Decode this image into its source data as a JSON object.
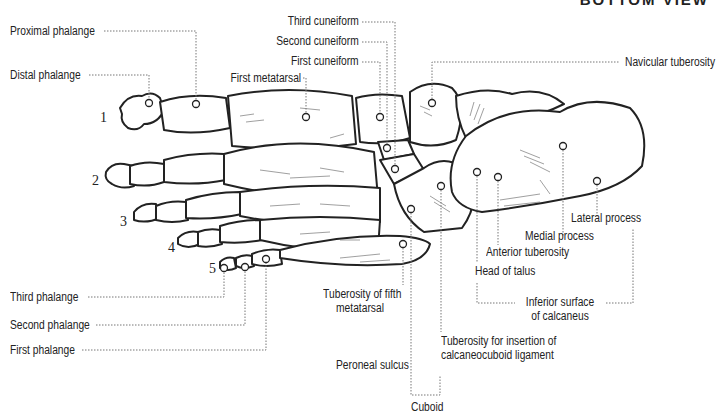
{
  "title": "BOTTOM VIEW",
  "toe_numbers": [
    "1",
    "2",
    "3",
    "4",
    "5"
  ],
  "labels": {
    "proximal_phalange": "Proximal phalange",
    "distal_phalange": "Distal phalange",
    "first_metatarsal": "First metatarsal",
    "third_cuneiform": "Third cuneiform",
    "second_cuneiform": "Second cuneiform",
    "first_cuneiform": "First cuneiform",
    "navicular_tuberosity": "Navicular tuberosity",
    "lateral_process": "Lateral process",
    "medial_process": "Medial process",
    "anterior_tuberosity": "Anterior tuberosity",
    "head_of_talus": "Head of talus",
    "inferior_surface_1": "Inferior surface",
    "inferior_surface_2": "of calcaneus",
    "tuberosity_fifth_1": "Tuberosity of fifth",
    "tuberosity_fifth_2": "metatarsal",
    "tuberosity_insertion_1": "Tuberosity for insertion of",
    "tuberosity_insertion_2": "calcaneocuboid ligament",
    "peroneal_sulcus": "Peroneal sulcus",
    "cuboid": "Cuboid",
    "third_phalange": "Third phalange",
    "second_phalange": "Second phalange",
    "first_phalange": "First phalange"
  },
  "colors": {
    "ink": "#222222",
    "leader": "#777777",
    "background": "#ffffff"
  }
}
